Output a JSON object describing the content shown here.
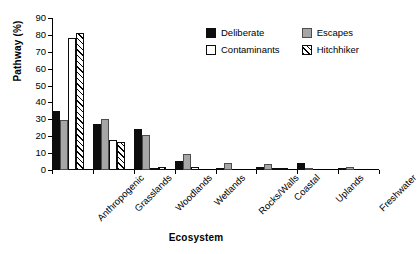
{
  "chart_data": {
    "type": "bar",
    "title": "",
    "xlabel": "Ecosystem",
    "ylabel": "Pathway (%)",
    "ylim": [
      0,
      90
    ],
    "ytick_step": 10,
    "yticks": [
      0,
      10,
      20,
      30,
      40,
      50,
      60,
      70,
      80,
      90
    ],
    "grid": false,
    "legend_position": "upper right (inside plot)",
    "categories": [
      "Anthropogenic",
      "Grasslands",
      "Woodlands",
      "Wetlands",
      "Rocks/Walls",
      "Coastal",
      "Uplands",
      "Freshwater"
    ],
    "series": [
      {
        "name": "Deliberate",
        "fill": "solid-black",
        "color": "#0d0d0d",
        "values": [
          35,
          27,
          24,
          5.5,
          0.5,
          2,
          4,
          0.8
        ]
      },
      {
        "name": "Escapes",
        "fill": "solid-gray",
        "color": "#a6a6a6",
        "values": [
          29.5,
          30.5,
          20.5,
          9.5,
          4,
          3.5,
          1,
          1.5
        ]
      },
      {
        "name": "Contaminants",
        "fill": "white-outline",
        "color": "#ffffff",
        "values": [
          78,
          18,
          1,
          1.5,
          0,
          1,
          0,
          0
        ]
      },
      {
        "name": "Hitchhiker",
        "fill": "diagonal-hatch",
        "color": "#ffffff",
        "values": [
          81,
          16.5,
          1.5,
          0,
          0,
          0.8,
          0,
          0
        ]
      }
    ]
  }
}
